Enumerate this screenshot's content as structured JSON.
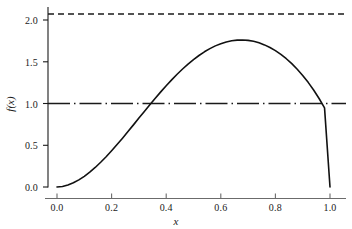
{
  "chart_data": {
    "type": "line",
    "title": "",
    "xlabel": "x",
    "ylabel": "f(x)",
    "xlim": [
      -0.04,
      1.06
    ],
    "ylim": [
      -0.08,
      2.22
    ],
    "grid": false,
    "legend": null,
    "xticks": [
      "0.0",
      "0.2",
      "0.4",
      "0.6",
      "0.8",
      "1.0"
    ],
    "xtick_values": [
      0.0,
      0.2,
      0.4,
      0.6,
      0.8,
      1.0
    ],
    "yticks": [
      "0.0",
      "0.5",
      "1.0",
      "1.5",
      "2.0"
    ],
    "ytick_values": [
      0.0,
      0.5,
      1.0,
      1.5,
      2.0
    ],
    "series": [
      {
        "name": "f(x)",
        "style": "solid",
        "color": "#111111",
        "x": [
          0.0,
          0.02,
          0.04,
          0.06,
          0.08,
          0.1,
          0.12,
          0.14,
          0.16,
          0.18,
          0.2,
          0.22,
          0.24,
          0.26,
          0.28,
          0.3,
          0.32,
          0.34,
          0.36,
          0.38,
          0.4,
          0.42,
          0.44,
          0.46,
          0.48,
          0.5,
          0.52,
          0.54,
          0.56,
          0.58,
          0.6,
          0.62,
          0.64,
          0.66,
          0.68,
          0.7,
          0.72,
          0.74,
          0.76,
          0.78,
          0.8,
          0.82,
          0.84,
          0.86,
          0.88,
          0.9,
          0.92,
          0.94,
          0.96,
          0.98,
          1.0
        ],
        "y": [
          0.0,
          0.006,
          0.023,
          0.05,
          0.085,
          0.128,
          0.178,
          0.234,
          0.296,
          0.363,
          0.434,
          0.508,
          0.585,
          0.664,
          0.744,
          0.825,
          0.905,
          0.985,
          1.063,
          1.139,
          1.213,
          1.283,
          1.35,
          1.413,
          1.472,
          1.526,
          1.575,
          1.619,
          1.657,
          1.69,
          1.716,
          1.737,
          1.751,
          1.759,
          1.761,
          1.756,
          1.745,
          1.727,
          1.702,
          1.671,
          1.633,
          1.588,
          1.536,
          1.477,
          1.41,
          1.336,
          1.253,
          1.162,
          1.06,
          0.947,
          0.0
        ]
      },
      {
        "name": "upper bound",
        "style": "dashed",
        "color": "#111111",
        "y_constant": 2.07,
        "x_range": [
          -0.04,
          1.06
        ]
      },
      {
        "name": "reference level",
        "style": "dashdot",
        "color": "#111111",
        "y_constant": 1.0,
        "x_range": [
          -0.04,
          1.06
        ]
      }
    ],
    "annotations": {
      "peak_x": 0.6,
      "peak_y": 2.07,
      "left_crossing_x": 0.33,
      "right_crossing_x": 0.84
    },
    "spines": {
      "left": true,
      "bottom": true,
      "top": false,
      "right": false
    }
  }
}
